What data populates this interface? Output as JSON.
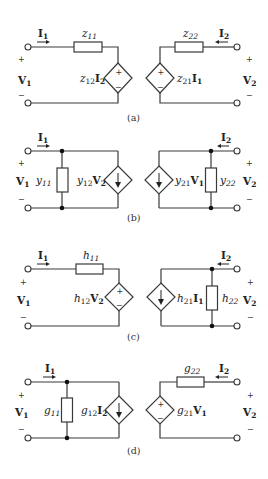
{
  "figure": {
    "panels": [
      {
        "id": "a",
        "caption": "(a)",
        "name": "z-parameter model",
        "port1": {
          "current": "I",
          "current_sub": "1",
          "voltage": "V",
          "voltage_sub": "1",
          "plus": "+",
          "minus": "−"
        },
        "port2": {
          "current": "I",
          "current_sub": "2",
          "voltage": "V",
          "voltage_sub": "2",
          "plus": "+",
          "minus": "−"
        },
        "left_element": {
          "type": "series-impedance",
          "label": "z",
          "label_sub": "11"
        },
        "left_source": {
          "type": "dependent-voltage-source",
          "coef": "z",
          "coef_sub": "12",
          "ctrl": "I",
          "ctrl_sub": "2",
          "plus": "+",
          "minus": "−"
        },
        "right_source": {
          "type": "dependent-voltage-source",
          "coef": "z",
          "coef_sub": "21",
          "ctrl": "I",
          "ctrl_sub": "1",
          "plus": "+",
          "minus": "−"
        },
        "right_element": {
          "type": "series-impedance",
          "label": "z",
          "label_sub": "22"
        }
      },
      {
        "id": "b",
        "caption": "(b)",
        "name": "y-parameter model",
        "port1": {
          "current": "I",
          "current_sub": "1",
          "voltage": "V",
          "voltage_sub": "1",
          "plus": "+",
          "minus": "−"
        },
        "port2": {
          "current": "I",
          "current_sub": "2",
          "voltage": "V",
          "voltage_sub": "2",
          "plus": "+",
          "minus": "−"
        },
        "left_element": {
          "type": "shunt-admittance",
          "label": "y",
          "label_sub": "11"
        },
        "left_source": {
          "type": "dependent-current-source",
          "coef": "y",
          "coef_sub": "12",
          "ctrl": "V",
          "ctrl_sub": "2"
        },
        "right_source": {
          "type": "dependent-current-source",
          "coef": "y",
          "coef_sub": "21",
          "ctrl": "V",
          "ctrl_sub": "1"
        },
        "right_element": {
          "type": "shunt-admittance",
          "label": "y",
          "label_sub": "22"
        }
      },
      {
        "id": "c",
        "caption": "(c)",
        "name": "h-parameter model",
        "port1": {
          "current": "I",
          "current_sub": "1",
          "voltage": "V",
          "voltage_sub": "1",
          "plus": "+",
          "minus": "−"
        },
        "port2": {
          "current": "I",
          "current_sub": "2",
          "voltage": "V",
          "voltage_sub": "2",
          "plus": "+",
          "minus": "−"
        },
        "left_element": {
          "type": "series-impedance",
          "label": "h",
          "label_sub": "11"
        },
        "left_source": {
          "type": "dependent-voltage-source",
          "coef": "h",
          "coef_sub": "12",
          "ctrl": "V",
          "ctrl_sub": "2",
          "plus": "+",
          "minus": "−"
        },
        "right_source": {
          "type": "dependent-current-source",
          "coef": "h",
          "coef_sub": "21",
          "ctrl": "I",
          "ctrl_sub": "1"
        },
        "right_element": {
          "type": "shunt-admittance",
          "label": "h",
          "label_sub": "22"
        }
      },
      {
        "id": "d",
        "caption": "(d)",
        "name": "g-parameter model",
        "port1": {
          "current": "I",
          "current_sub": "1",
          "voltage": "V",
          "voltage_sub": "1",
          "plus": "+",
          "minus": "−"
        },
        "port2": {
          "current": "I",
          "current_sub": "2",
          "voltage": "V",
          "voltage_sub": "2",
          "plus": "+",
          "minus": "−"
        },
        "left_element": {
          "type": "shunt-admittance",
          "label": "g",
          "label_sub": "11"
        },
        "left_source": {
          "type": "dependent-current-source",
          "coef": "g",
          "coef_sub": "12",
          "ctrl": "I",
          "ctrl_sub": "2"
        },
        "right_source": {
          "type": "dependent-voltage-source",
          "coef": "g",
          "coef_sub": "21",
          "ctrl": "V",
          "ctrl_sub": "1",
          "plus": "+",
          "minus": "−"
        },
        "right_element": {
          "type": "series-impedance",
          "label": "g",
          "label_sub": "22"
        }
      }
    ]
  }
}
